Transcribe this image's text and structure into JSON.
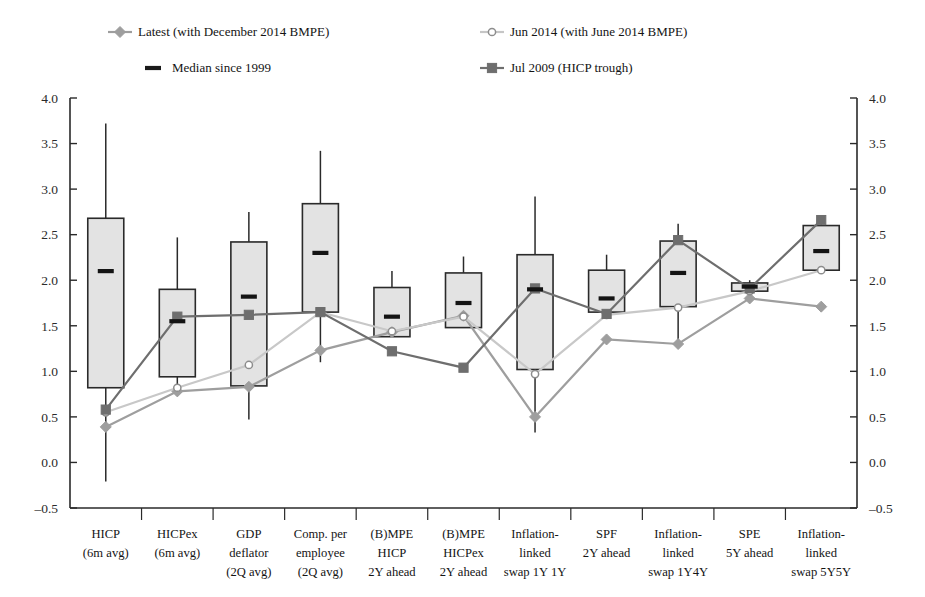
{
  "chart_data": {
    "type": "box",
    "title": "",
    "subtitle": "",
    "xlabel": "",
    "ylabel": "",
    "ylim": [
      -0.5,
      4.0
    ],
    "ytick_step": 0.5,
    "yticks": [
      "4.0",
      "3.5",
      "3.0",
      "2.5",
      "2.0",
      "1.5",
      "1.0",
      "0.5",
      "0.0",
      "-0.5"
    ],
    "ytick_values": [
      4.0,
      3.5,
      3.0,
      2.5,
      2.0,
      1.5,
      1.0,
      0.5,
      0.0,
      -0.5
    ],
    "grid": false,
    "dual_y_axis": true,
    "legend_position": "top",
    "legend": [
      {
        "label": "Latest (with December 2014 BMPE)",
        "marker": "diamond",
        "color": "#9e9e9e",
        "line": true
      },
      {
        "label": "Jun 2014 (with June 2014 BMPE)",
        "marker": "open-circle",
        "color": "#c6c6c6",
        "line": true
      },
      {
        "label": "Median since 1999",
        "marker": "dash",
        "color": "#1a1a1a",
        "line": false
      },
      {
        "label": "Jul 2009 (HICP trough)",
        "marker": "square",
        "color": "#6e6e6e",
        "line": true
      }
    ],
    "categories": [
      "HICP\n(6m avg)",
      "HICPex\n(6m avg)",
      "GDP\ndeflator\n(2Q avg)",
      "Comp. per\nemployee\n(2Q avg)",
      "(B)MPE\nHICP\n2Y ahead",
      "(B)MPE\nHICPex\n2Y ahead",
      "Inflation-\nlinked\nswap 1Y 1Y",
      "SPF\n2Y ahead",
      "Inflation-\nlinked\nswap 1Y4Y",
      "SPE\n5Y ahead",
      "Inflation-\nlinked\nswap 5Y5Y"
    ],
    "category_lines": [
      [
        "HICP",
        "(6m avg)"
      ],
      [
        "HICPex",
        "(6m avg)"
      ],
      [
        "GDP",
        "deflator",
        "(2Q avg)"
      ],
      [
        "Comp. per",
        "employee",
        "(2Q avg)"
      ],
      [
        "(B)MPE",
        "HICP",
        "2Y ahead"
      ],
      [
        "(B)MPE",
        "HICPex",
        "2Y ahead"
      ],
      [
        "Inflation-",
        "linked",
        "swap 1Y 1Y"
      ],
      [
        "SPF",
        "2Y ahead"
      ],
      [
        "Inflation-",
        "linked",
        "swap 1Y4Y"
      ],
      [
        "SPE",
        "5Y ahead"
      ],
      [
        "Inflation-",
        "linked",
        "swap 5Y5Y"
      ]
    ],
    "boxes": [
      {
        "whisker_low": -0.21,
        "q1": 0.82,
        "median": 2.1,
        "q3": 2.68,
        "whisker_high": 3.72
      },
      {
        "whisker_low": 0.8,
        "q1": 0.94,
        "median": 1.55,
        "q3": 1.9,
        "whisker_high": 2.47
      },
      {
        "whisker_low": 0.47,
        "q1": 0.84,
        "median": 1.82,
        "q3": 2.42,
        "whisker_high": 2.75
      },
      {
        "whisker_low": 1.1,
        "q1": 1.65,
        "median": 2.3,
        "q3": 2.84,
        "whisker_high": 3.42
      },
      {
        "whisker_low": 1.38,
        "q1": 1.38,
        "median": 1.6,
        "q3": 1.92,
        "whisker_high": 2.1
      },
      {
        "whisker_low": 1.48,
        "q1": 1.48,
        "median": 1.75,
        "q3": 2.08,
        "whisker_high": 2.26
      },
      {
        "whisker_low": 0.33,
        "q1": 1.02,
        "median": 1.9,
        "q3": 2.28,
        "whisker_high": 2.92
      },
      {
        "whisker_low": 1.62,
        "q1": 1.65,
        "median": 1.8,
        "q3": 2.11,
        "whisker_high": 2.28
      },
      {
        "whisker_low": 1.3,
        "q1": 1.71,
        "median": 2.08,
        "q3": 2.43,
        "whisker_high": 2.62
      },
      {
        "whisker_low": 1.84,
        "q1": 1.88,
        "median": 1.93,
        "q3": 1.97,
        "whisker_high": 2.0
      },
      {
        "whisker_low": 2.11,
        "q1": 2.11,
        "median": 2.32,
        "q3": 2.6,
        "whisker_high": 2.7
      }
    ],
    "series": [
      {
        "name": "Latest (with December 2014 BMPE)",
        "marker": "diamond",
        "color": "#9e9e9e",
        "values": [
          0.39,
          0.78,
          0.83,
          1.23,
          1.43,
          1.61,
          0.5,
          1.35,
          1.3,
          1.8,
          1.71
        ]
      },
      {
        "name": "Jun 2014 (with June 2014 BMPE)",
        "marker": "open-circle",
        "color": "#c8c8c8",
        "values": [
          0.55,
          0.82,
          1.07,
          1.65,
          1.44,
          1.6,
          0.97,
          1.62,
          1.7,
          1.88,
          2.11
        ]
      },
      {
        "name": "Jul 2009 (HICP trough)",
        "marker": "square",
        "color": "#6e6e6e",
        "values": [
          0.58,
          1.6,
          1.62,
          1.65,
          1.22,
          1.04,
          1.91,
          1.63,
          2.44,
          1.91,
          2.66
        ]
      }
    ]
  },
  "axis": {
    "left_ticks": [
      "4.0",
      "3.5",
      "3.0",
      "2.5",
      "2.0",
      "1.5",
      "1.0",
      "0.5",
      "0.0",
      "-0.5"
    ],
    "right_ticks": [
      "4.0",
      "3.5",
      "3.0",
      "2.5",
      "2.0",
      "1.5",
      "1.0",
      "0.5",
      "0.0",
      "-0.5"
    ]
  },
  "colors": {
    "box_fill": "#e3e3e3",
    "box_edge": "#2a2a2a",
    "median": "#141414",
    "latest": "#9e9e9e",
    "jun2014": "#c8c8c8",
    "jul2009": "#6e6e6e",
    "axis": "#2a2a2a",
    "background": "#ffffff"
  }
}
